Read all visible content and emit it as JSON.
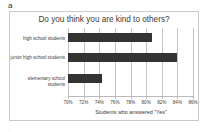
{
  "panel": {
    "label": "a",
    "footer_mark": "·"
  },
  "chart_data": {
    "type": "bar",
    "orientation": "horizontal",
    "title": "Do you think you are kind to others?",
    "xlabel": "Students who answered \"Yes\"",
    "ylabel": "",
    "categories": [
      "high school students",
      "junior high school students",
      "elementary school students"
    ],
    "values": [
      80.7,
      83.9,
      74.4
    ],
    "xlim": [
      70,
      86
    ],
    "xticks": [
      70,
      72,
      74,
      76,
      78,
      80,
      82,
      84,
      86
    ],
    "xtick_labels": [
      "70%",
      "72%",
      "74%",
      "76%",
      "78%",
      "80%",
      "82%",
      "84%",
      "86%"
    ],
    "grid": true,
    "legend": false,
    "bar_color": "#333333",
    "grid_color": "#c4c4c4",
    "axis_color": "#b9b9b9",
    "frame_color": "#c9c9c9",
    "text_color": "#3b3b3b"
  }
}
